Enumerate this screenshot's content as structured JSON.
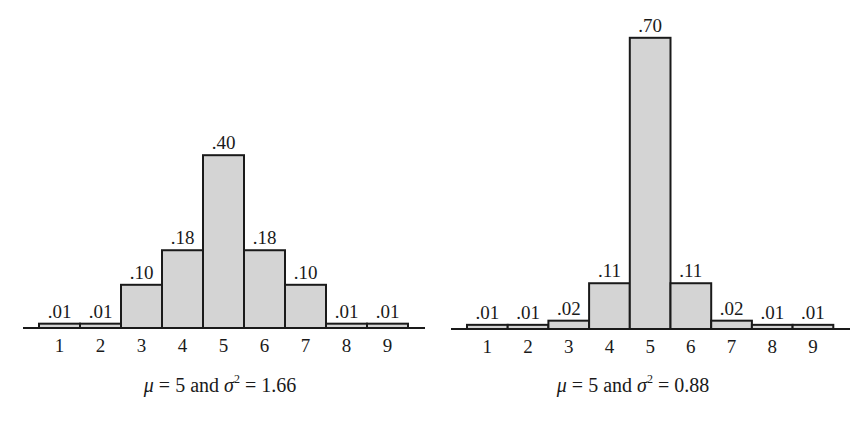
{
  "chart_data": [
    {
      "type": "bar",
      "title": "",
      "xlabel": "",
      "ylabel": "",
      "categories": [
        "1",
        "2",
        "3",
        "4",
        "5",
        "6",
        "7",
        "8",
        "9"
      ],
      "values": [
        0.01,
        0.01,
        0.1,
        0.18,
        0.4,
        0.18,
        0.1,
        0.01,
        0.01
      ],
      "value_labels": [
        ".01",
        ".01",
        ".10",
        ".18",
        ".40",
        ".18",
        ".10",
        ".01",
        ".01"
      ],
      "caption": {
        "mu_symbol": "μ",
        "eq1": " = 5 and ",
        "sigma_symbol": "σ",
        "exp": "2",
        "eq2": " = 1.66"
      },
      "mean": 5,
      "variance": 1.66,
      "grid": false,
      "legend": null,
      "ylim": [
        0,
        0.4
      ]
    },
    {
      "type": "bar",
      "title": "",
      "xlabel": "",
      "ylabel": "",
      "categories": [
        "1",
        "2",
        "3",
        "4",
        "5",
        "6",
        "7",
        "8",
        "9"
      ],
      "values": [
        0.01,
        0.01,
        0.02,
        0.11,
        0.7,
        0.11,
        0.02,
        0.01,
        0.01
      ],
      "value_labels": [
        ".01",
        ".01",
        ".02",
        ".11",
        ".70",
        ".11",
        ".02",
        ".01",
        ".01"
      ],
      "caption": {
        "mu_symbol": "μ",
        "eq1": " = 5 and ",
        "sigma_symbol": "σ",
        "exp": "2",
        "eq2": " = 0.88"
      },
      "mean": 5,
      "variance": 0.88,
      "grid": false,
      "legend": null,
      "ylim": [
        0,
        0.7
      ]
    }
  ],
  "style": {
    "bar_fill": "#d4d4d4",
    "stroke": "#1a1a1a"
  }
}
